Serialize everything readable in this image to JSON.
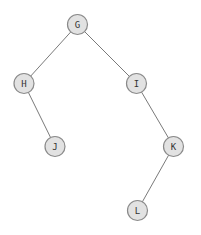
{
  "diagram": {
    "type": "binary-tree",
    "nodes": [
      {
        "id": "G",
        "label": "G",
        "x": 77.5,
        "y": 24.5
      },
      {
        "id": "H",
        "label": "H",
        "x": 24,
        "y": 83.5
      },
      {
        "id": "I",
        "label": "I",
        "x": 136.5,
        "y": 83.5
      },
      {
        "id": "J",
        "label": "J",
        "x": 55,
        "y": 146.5
      },
      {
        "id": "K",
        "label": "K",
        "x": 173.5,
        "y": 146.5
      },
      {
        "id": "L",
        "label": "L",
        "x": 137.5,
        "y": 210.5
      }
    ],
    "edges": [
      {
        "from": "G",
        "to": "H"
      },
      {
        "from": "G",
        "to": "I"
      },
      {
        "from": "H",
        "to": "J"
      },
      {
        "from": "I",
        "to": "K"
      },
      {
        "from": "K",
        "to": "L"
      }
    ],
    "node_radius": 10,
    "colors": {
      "node_fill": "#e2e2e2",
      "node_stroke": "#8a8a8a",
      "edge": "#7a7a7a",
      "label": "#333333"
    }
  }
}
